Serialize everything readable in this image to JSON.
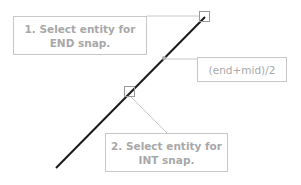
{
  "diagram": {
    "callouts": [
      {
        "id": "end",
        "line1": "1. Select entity for",
        "line2": "END snap."
      },
      {
        "id": "mid",
        "text": "(end+mid)/2"
      },
      {
        "id": "int",
        "line1": "2. Select entity for",
        "line2": "INT snap."
      }
    ],
    "colors": {
      "line": "#1a1a1a",
      "leader": "#c8c8c8",
      "text": "#a8a8a8",
      "marker": "#b0b0b0"
    }
  }
}
